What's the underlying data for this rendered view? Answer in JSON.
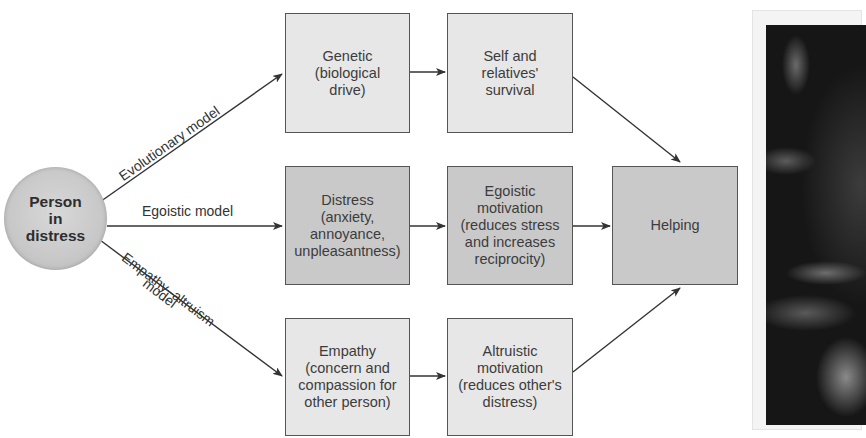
{
  "diagram": {
    "source_node": {
      "label": "Person\nin\ndistress"
    },
    "models": [
      {
        "id": "evolutionary",
        "label": "Evolutionary model"
      },
      {
        "id": "egoistic",
        "label": "Egoistic model"
      },
      {
        "id": "empathy",
        "label_line1": "Empathy–altruism",
        "label_line2": "model"
      }
    ],
    "nodes": {
      "genetic": "Genetic\n(biological\ndrive)",
      "survival": "Self and\nrelatives'\nsurvival",
      "distress": "Distress\n(anxiety,\nannoyance,\nunpleasantness)",
      "egoistic_motivation": "Egoistic\nmotivation\n(reduces stress\nand increases\nreciprocity)",
      "empathy": "Empathy\n(concern and\ncompassion for\nother person)",
      "altruistic_motivation": "Altruistic\nmotivation\n(reduces other's\ndistress)",
      "helping": "Helping"
    },
    "edges": [
      {
        "from": "Person in distress",
        "to": "Genetic (biological drive)",
        "label": "Evolutionary model"
      },
      {
        "from": "Person in distress",
        "to": "Distress (anxiety, annoyance, unpleasantness)",
        "label": "Egoistic model"
      },
      {
        "from": "Person in distress",
        "to": "Empathy (concern and compassion for other person)",
        "label": "Empathy–altruism model"
      },
      {
        "from": "Genetic (biological drive)",
        "to": "Self and relatives' survival"
      },
      {
        "from": "Distress (anxiety, annoyance, unpleasantness)",
        "to": "Egoistic motivation (reduces stress and increases reciprocity)"
      },
      {
        "from": "Empathy (concern and compassion for other person)",
        "to": "Altruistic motivation (reduces other's distress)"
      },
      {
        "from": "Self and relatives' survival",
        "to": "Helping"
      },
      {
        "from": "Egoistic motivation (reduces stress and increases reciprocity)",
        "to": "Helping"
      },
      {
        "from": "Altruistic motivation (reduces other's distress)",
        "to": "Helping"
      }
    ],
    "colors": {
      "light_box": "#e7e7e7",
      "dark_box": "#c9c9c9",
      "border": "#555555",
      "arrow": "#333333"
    }
  },
  "photo": {
    "description": "partially visible dark photograph at right edge"
  }
}
